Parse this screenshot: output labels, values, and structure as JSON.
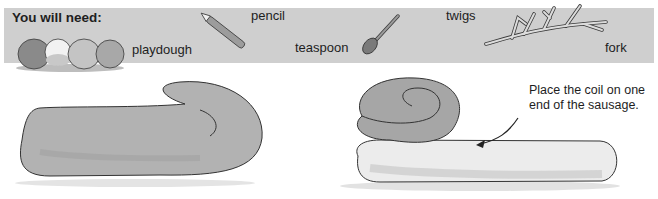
{
  "needs": {
    "title": "You will need:",
    "items": [
      {
        "label": "playdough",
        "icon": "playdough-balls-icon"
      },
      {
        "label": "pencil",
        "icon": "pencil-icon"
      },
      {
        "label": "teaspoon",
        "icon": "teaspoon-icon"
      },
      {
        "label": "twigs",
        "icon": "twigs-icon"
      },
      {
        "label": "fork",
        "icon": "fork-icon"
      }
    ]
  },
  "steps": [
    {
      "illustration": "rolled-sausage-with-curled-end"
    },
    {
      "illustration": "coil-placed-on-sausage",
      "caption": "Place the coil on one end of the sausage."
    }
  ],
  "colors": {
    "band": "#cfcfcf",
    "dough_dark": "#9a9a9a",
    "dough_mid": "#b4b4b4",
    "dough_light": "#e6e6e6",
    "outline": "#3a3a3a"
  }
}
